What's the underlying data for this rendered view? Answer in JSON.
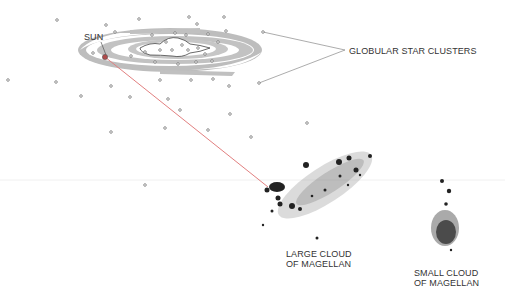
{
  "diagram": {
    "labels": {
      "sun": "SUN",
      "globular": "GLOBULAR STAR CLUSTERS",
      "lmc_line1": "LARGE CLOUD",
      "lmc_line2": "OF MAGELLAN",
      "smc_line1": "SMALL CLOUD",
      "smc_line2": "OF MAGELLAN"
    },
    "colors": {
      "galaxy_arm": "#b8b8b8",
      "sun_line": "#e07070",
      "leader": "#777777",
      "cluster_stroke": "#666666",
      "cloud": "#222222"
    }
  }
}
